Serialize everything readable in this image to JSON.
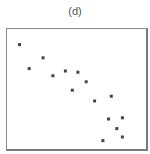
{
  "chart_data": {
    "type": "scatter",
    "title": "(d)",
    "xlabel": "",
    "ylabel": "",
    "xlim": [
      0,
      1
    ],
    "ylim": [
      0,
      1
    ],
    "grid": false,
    "legend": null,
    "axis_ticks": "none",
    "marker": {
      "shape": "square",
      "size_px": 3,
      "color": "#444444"
    },
    "frame_color": "#8a8a8a",
    "series": [
      {
        "name": "points",
        "points": [
          {
            "x": 0.09,
            "y": 0.87
          },
          {
            "x": 0.16,
            "y": 0.67
          },
          {
            "x": 0.26,
            "y": 0.76
          },
          {
            "x": 0.33,
            "y": 0.61
          },
          {
            "x": 0.42,
            "y": 0.65
          },
          {
            "x": 0.51,
            "y": 0.64
          },
          {
            "x": 0.57,
            "y": 0.56
          },
          {
            "x": 0.47,
            "y": 0.49
          },
          {
            "x": 0.63,
            "y": 0.4
          },
          {
            "x": 0.75,
            "y": 0.44
          },
          {
            "x": 0.73,
            "y": 0.25
          },
          {
            "x": 0.83,
            "y": 0.26
          },
          {
            "x": 0.79,
            "y": 0.17
          },
          {
            "x": 0.83,
            "y": 0.1
          },
          {
            "x": 0.69,
            "y": 0.07
          }
        ]
      }
    ]
  }
}
